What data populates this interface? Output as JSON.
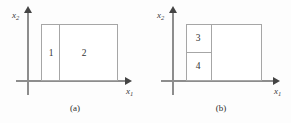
{
  "figure": {
    "background_color": "#fdfdfd",
    "line_color": "#a6a6a6",
    "axis_color": "#8d8d8d",
    "text_color": "#333333"
  },
  "panels": [
    {
      "id": "a",
      "caption": "(a)",
      "axes": {
        "x_label": "x",
        "x_sub": "1",
        "y_label": "x",
        "y_sub": "2"
      },
      "regions": [
        {
          "label": "1"
        },
        {
          "label": "2"
        }
      ],
      "partition": {
        "type": "vertical-split",
        "description": "Rectangle divided by one vertical line into a narrow left region (1) and a wide right region (2)."
      }
    },
    {
      "id": "b",
      "caption": "(b)",
      "axes": {
        "x_label": "x",
        "x_sub": "1",
        "y_label": "x",
        "y_sub": "2"
      },
      "regions": [
        {
          "label": "3"
        },
        {
          "label": "4"
        }
      ],
      "partition": {
        "type": "vertical-then-horizontal-split",
        "description": "Rectangle divided by one vertical line; the narrow left column is further split horizontally into an upper region (3) and a lower region (4)."
      }
    }
  ]
}
